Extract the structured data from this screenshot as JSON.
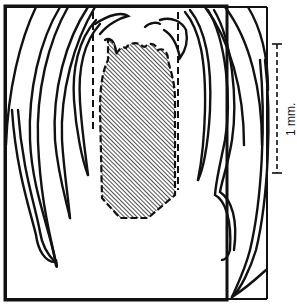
{
  "figure": {
    "type": "botanical-section-diagram",
    "colors": {
      "outline": "#111111",
      "hatch": "#222222",
      "background": "#ffffff"
    },
    "frame": {
      "x": 5,
      "y": 6,
      "width": 111,
      "height": 147
    },
    "hatched_region": {
      "label": ""
    },
    "scale_bar": {
      "label": "1 mm.",
      "orientation": "vertical",
      "length_px": 129
    }
  }
}
